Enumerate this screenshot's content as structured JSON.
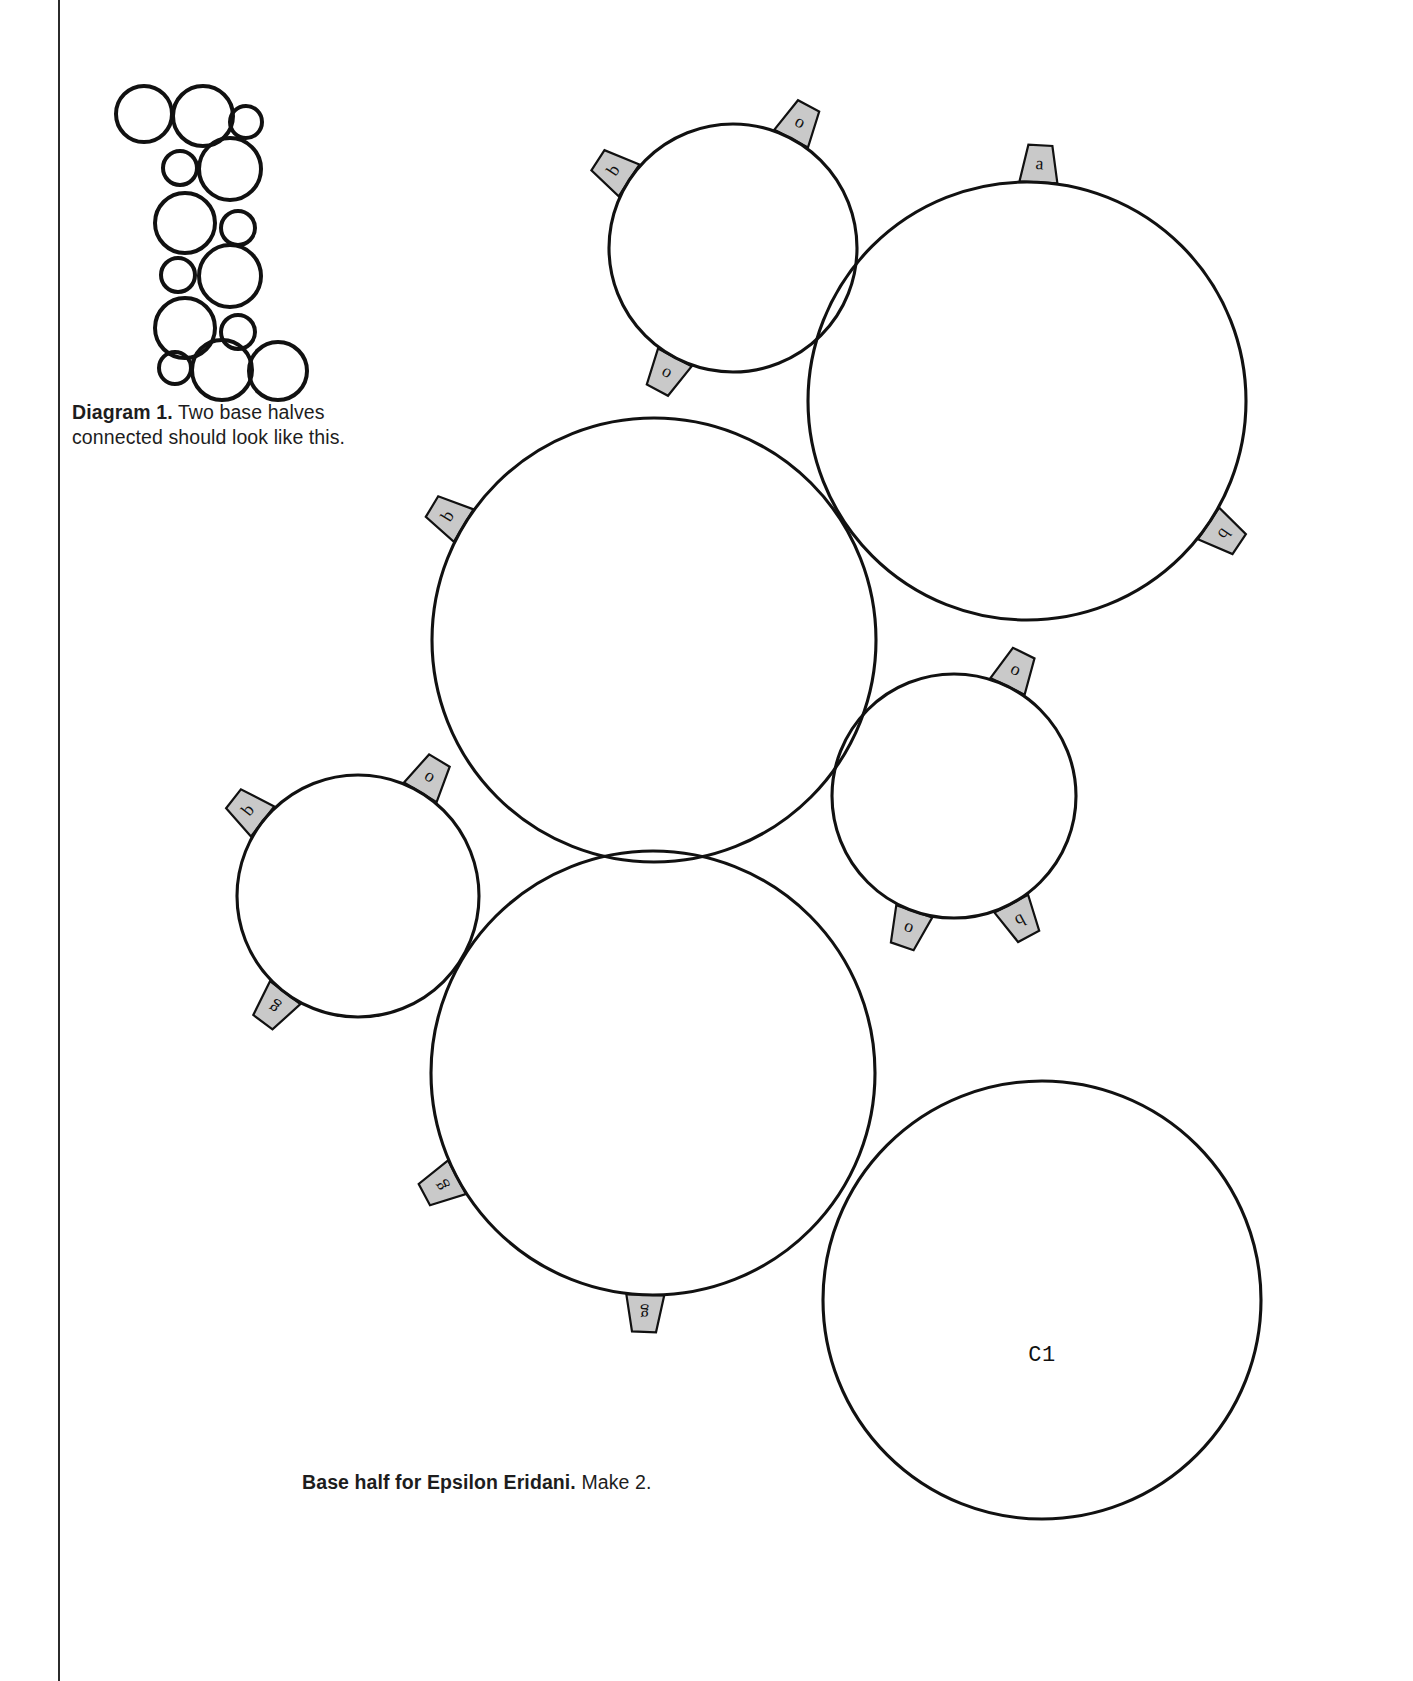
{
  "page": {
    "width": 1413,
    "height": 1681,
    "background": "#ffffff",
    "ink_color": "#111111",
    "tab_fill_color": "#c9c9c9"
  },
  "diagram": {
    "id": "diagram-1",
    "caption_lead": "Diagram 1.",
    "caption_rest": " Two base halves connected should look like this.",
    "thumbnail_alt": "cluster-of-overlapping-circles",
    "thumbnail_circles": [
      {
        "cx": 34,
        "cy": 36,
        "r": 30
      },
      {
        "cx": 93,
        "cy": 38,
        "r": 32
      },
      {
        "cx": 136,
        "cy": 44,
        "r": 18
      },
      {
        "cx": 70,
        "cy": 90,
        "r": 19
      },
      {
        "cx": 120,
        "cy": 91,
        "r": 33
      },
      {
        "cx": 75,
        "cy": 145,
        "r": 32
      },
      {
        "cx": 128,
        "cy": 150,
        "r": 19
      },
      {
        "cx": 68,
        "cy": 197,
        "r": 19
      },
      {
        "cx": 120,
        "cy": 198,
        "r": 33
      },
      {
        "cx": 75,
        "cy": 250,
        "r": 32
      },
      {
        "cx": 128,
        "cy": 254,
        "r": 19
      },
      {
        "cx": 65,
        "cy": 290,
        "r": 18
      },
      {
        "cx": 112,
        "cy": 292,
        "r": 32
      },
      {
        "cx": 168,
        "cy": 293,
        "r": 31
      }
    ]
  },
  "pattern": {
    "caption_lead": "Base half for Epsilon Eridani.",
    "caption_rest": " Make 2.",
    "pieces": [
      {
        "name": "circle-small-top",
        "cx": 733,
        "cy": 248,
        "r": 124,
        "label": "",
        "tabs": [
          {
            "letter": "o",
            "angle": -62
          },
          {
            "letter": "b",
            "angle": -147
          },
          {
            "letter": "o",
            "angle": 118
          }
        ]
      },
      {
        "name": "circle-large-top-right",
        "cx": 1027,
        "cy": 401,
        "r": 219,
        "label": "",
        "tabs": [
          {
            "letter": "a",
            "angle": -87
          },
          {
            "letter": "b",
            "angle": 34
          }
        ]
      },
      {
        "name": "circle-large-center",
        "cx": 654,
        "cy": 640,
        "r": 222,
        "label": "",
        "tabs": [
          {
            "letter": "b",
            "angle": -149
          }
        ]
      },
      {
        "name": "circle-medium-right",
        "cx": 954,
        "cy": 796,
        "r": 122,
        "label": "",
        "tabs": [
          {
            "letter": "o",
            "angle": -64
          },
          {
            "letter": "b",
            "angle": 62
          },
          {
            "letter": "o",
            "angle": 109
          }
        ]
      },
      {
        "name": "circle-small-left",
        "cx": 358,
        "cy": 896,
        "r": 121,
        "label": "",
        "tabs": [
          {
            "letter": "o",
            "angle": -59
          },
          {
            "letter": "b",
            "angle": -142
          },
          {
            "letter": "g",
            "angle": 127
          }
        ]
      },
      {
        "name": "circle-large-bottom-center",
        "cx": 653,
        "cy": 1073,
        "r": 222,
        "label": "",
        "tabs": [
          {
            "letter": "g",
            "angle": 152
          },
          {
            "letter": "g",
            "angle": 92
          }
        ]
      },
      {
        "name": "circle-large-bottom-right",
        "cx": 1042,
        "cy": 1300,
        "r": 219,
        "label": "C1",
        "tabs": []
      }
    ],
    "tab_legend": [
      "o",
      "b",
      "a",
      "g"
    ]
  }
}
